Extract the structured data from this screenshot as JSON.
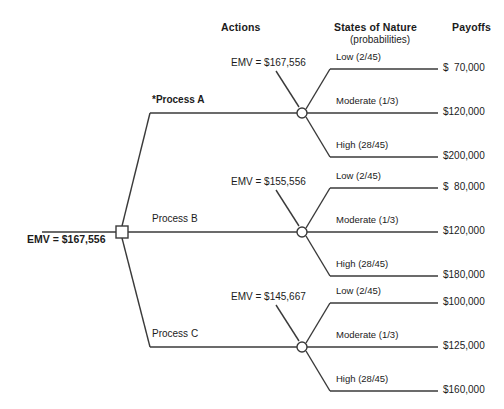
{
  "headers": {
    "actions": "Actions",
    "states": "States of Nature",
    "states_sub": "(probabilities)",
    "payoffs": "Payoffs"
  },
  "root": {
    "emv_label": "EMV = $167,556"
  },
  "style": {
    "line_color": "#3a3a3a",
    "text_color": "#1b1b1b",
    "node_fill": "#ffffff"
  },
  "branches": [
    {
      "action": "*Process A",
      "best": true,
      "emv_label": "EMV = $167,556",
      "states": [
        {
          "name": "Low (2/45)",
          "payoff": "$  70,000"
        },
        {
          "name": "Moderate (1/3)",
          "payoff": "$120,000"
        },
        {
          "name": "High (28/45)",
          "payoff": "$200,000"
        }
      ]
    },
    {
      "action": "Process B",
      "best": false,
      "emv_label": "EMV = $155,556",
      "states": [
        {
          "name": "Low (2/45)",
          "payoff": "$  80,000"
        },
        {
          "name": "Moderate (1/3)",
          "payoff": "$120,000"
        },
        {
          "name": "High (28/45)",
          "payoff": "$180,000"
        }
      ]
    },
    {
      "action": "Process C",
      "best": false,
      "emv_label": "EMV = $145,667",
      "states": [
        {
          "name": "Low (2/45)",
          "payoff": "$100,000"
        },
        {
          "name": "Moderate (1/3)",
          "payoff": "$125,000"
        },
        {
          "name": "High (28/45)",
          "payoff": "$160,000"
        }
      ]
    }
  ],
  "chart_data": {
    "type": "diagram",
    "diagram_type": "decision-tree",
    "title": "",
    "root_node": {
      "kind": "decision",
      "emv": 167556
    },
    "decision_alternatives": [
      {
        "name": "Process A",
        "optimal": true,
        "emv": 167556,
        "outcomes": [
          {
            "state": "Low",
            "probability": "2/45",
            "payoff": 70000
          },
          {
            "state": "Moderate",
            "probability": "1/3",
            "payoff": 120000
          },
          {
            "state": "High",
            "probability": "28/45",
            "payoff": 200000
          }
        ]
      },
      {
        "name": "Process B",
        "optimal": false,
        "emv": 155556,
        "outcomes": [
          {
            "state": "Low",
            "probability": "2/45",
            "payoff": 80000
          },
          {
            "state": "Moderate",
            "probability": "1/3",
            "payoff": 120000
          },
          {
            "state": "High",
            "probability": "28/45",
            "payoff": 180000
          }
        ]
      },
      {
        "name": "Process C",
        "optimal": false,
        "emv": 145667,
        "outcomes": [
          {
            "state": "Low",
            "probability": "2/45",
            "payoff": 100000
          },
          {
            "state": "Moderate",
            "probability": "1/3",
            "payoff": 125000
          },
          {
            "state": "High",
            "probability": "28/45",
            "payoff": 160000
          }
        ]
      }
    ],
    "column_headers": [
      "Actions",
      "States of Nature (probabilities)",
      "Payoffs"
    ]
  }
}
